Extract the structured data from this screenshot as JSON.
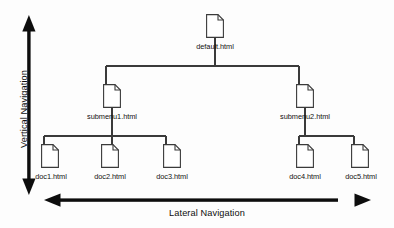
{
  "diagram": {
    "type": "site-map-tree",
    "background_color": "#fdfdfd",
    "line_color": "#3a3a3a",
    "arrow_color": "#0d0d0d",
    "icon_fill": "#ffffff",
    "icon_name": "document-page-icon",
    "nodes": [
      {
        "id": "root",
        "label": "default.html",
        "level": 0,
        "icon_x": 206,
        "icon_y": 14,
        "label_x": 215,
        "label_y": 46
      },
      {
        "id": "sub1",
        "label": "submenu1.html",
        "level": 1,
        "icon_x": 103,
        "icon_y": 84,
        "label_x": 112,
        "label_y": 116
      },
      {
        "id": "sub2",
        "label": "submenu2.html",
        "level": 1,
        "icon_x": 296,
        "icon_y": 84,
        "label_x": 305,
        "label_y": 116
      },
      {
        "id": "doc1",
        "label": "doc1.html",
        "level": 2,
        "icon_x": 41,
        "icon_y": 144,
        "label_x": 50,
        "label_y": 176
      },
      {
        "id": "doc2",
        "label": "doc2.html",
        "level": 2,
        "icon_x": 101,
        "icon_y": 144,
        "label_x": 110,
        "label_y": 176
      },
      {
        "id": "doc3",
        "label": "doc3.html",
        "level": 2,
        "icon_x": 163,
        "icon_y": 144,
        "label_x": 172,
        "label_y": 176
      },
      {
        "id": "doc4",
        "label": "doc4.html",
        "level": 2,
        "icon_x": 296,
        "icon_y": 144,
        "label_x": 305,
        "label_y": 176
      },
      {
        "id": "doc5",
        "label": "doc5.html",
        "level": 2,
        "icon_x": 351,
        "icon_y": 144,
        "label_x": 360,
        "label_y": 176
      }
    ],
    "edges": [
      {
        "from": "root",
        "to": "sub1"
      },
      {
        "from": "root",
        "to": "sub2"
      },
      {
        "from": "sub1",
        "to": "doc1"
      },
      {
        "from": "sub1",
        "to": "doc2"
      },
      {
        "from": "sub1",
        "to": "doc3"
      },
      {
        "from": "sub2",
        "to": "doc4"
      },
      {
        "from": "sub2",
        "to": "doc5"
      }
    ]
  },
  "axes": {
    "vertical": {
      "label": "Vertical Navigation",
      "arrow_name": "vertical-double-arrow",
      "direction": "double",
      "x": 29,
      "y_top": 18,
      "y_bottom": 190
    },
    "lateral": {
      "label": "Lateral Navigation",
      "arrow_name": "lateral-double-arrow",
      "direction": "double",
      "y": 200,
      "x_left": 45,
      "x_right": 370
    }
  }
}
